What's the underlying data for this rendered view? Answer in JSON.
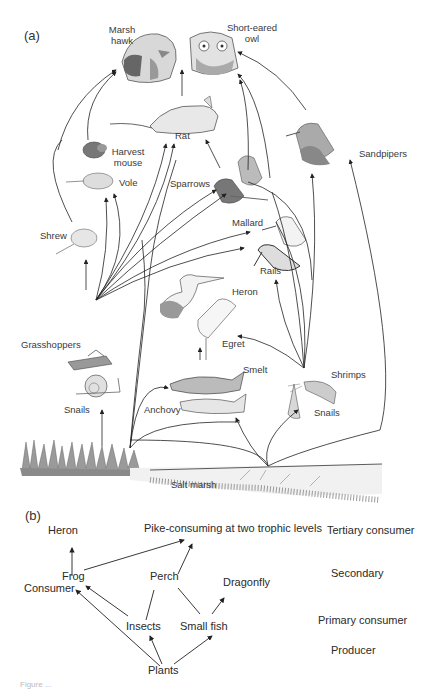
{
  "panel_a": {
    "label": "(a)",
    "organisms": {
      "marsh_hawk": "Marsh\nhawk",
      "marsh_hawk_l1": "Marsh",
      "marsh_hawk_l2": "hawk",
      "owl_l1": "Short-eared",
      "owl_l2": "owl",
      "rat": "Rat",
      "harvest_mouse_l1": "Harvest",
      "harvest_mouse_l2": "mouse",
      "vole": "Vole",
      "sparrows": "Sparrows",
      "sandpipers": "Sandpipers",
      "shrew": "Shrew",
      "mallard": "Mallard",
      "rails": "Rails",
      "heron": "Heron",
      "egret": "Egret",
      "grasshoppers": "Grasshoppers",
      "snails_left": "Snails",
      "smelt": "Smelt",
      "anchovy": "Anchovy",
      "shrimps": "Shrimps",
      "snails_right": "Snails",
      "salt_marsh": "Salt marsh"
    }
  },
  "panel_b": {
    "label": "(b)",
    "nodes": {
      "heron": "Heron",
      "pike": "Pike-consuming at two trophic levels",
      "frog": "Frog",
      "consumer": "Consumer",
      "perch": "Perch",
      "dragonfly": "Dragonfly",
      "insects": "Insects",
      "small_fish": "Small fish",
      "plants": "Plants"
    },
    "levels": {
      "tertiary": "Tertiary consumer",
      "secondary": "Secondary",
      "primary": "Primary consumer",
      "producer": "Producer"
    },
    "edges": [
      [
        "Plants",
        "Insects"
      ],
      [
        "Plants",
        "Small fish"
      ],
      [
        "Plants",
        "Frog/Consumer"
      ],
      [
        "Insects",
        "Frog"
      ],
      [
        "Insects",
        "Perch"
      ],
      [
        "Small fish",
        "Perch"
      ],
      [
        "Small fish",
        "Dragonfly"
      ],
      [
        "Frog",
        "Heron"
      ],
      [
        "Frog",
        "Pike"
      ],
      [
        "Perch",
        "Pike"
      ]
    ]
  },
  "caption": "Figure ..."
}
